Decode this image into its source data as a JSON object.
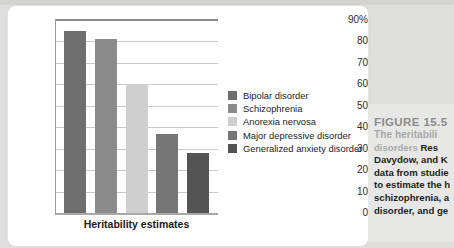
{
  "chart_data": {
    "type": "bar",
    "title": "",
    "xlabel": "Heritability estimates",
    "ylabel": "",
    "categories": [
      "Bipolar disorder",
      "Schizophrenia",
      "Anorexia nervosa",
      "Major depressive disorder",
      "Generalized anxiety disorder"
    ],
    "values": [
      85,
      81,
      60,
      37,
      28
    ],
    "colors": [
      "#6e6e6e",
      "#8a8a8a",
      "#cfcfcf",
      "#767676",
      "#545454"
    ],
    "ylim": [
      0,
      90
    ],
    "yticks": [
      "90%",
      "80",
      "70",
      "60",
      "50",
      "40",
      "30",
      "20",
      "10",
      "0"
    ],
    "ytick_values": [
      90,
      80,
      70,
      60,
      50,
      40,
      30,
      20,
      10,
      0
    ],
    "grid": true,
    "legend_position": "right"
  },
  "legend": {
    "items": [
      {
        "label": "Bipolar disorder",
        "color": "#6e6e6e"
      },
      {
        "label": "Schizophrenia",
        "color": "#8a8a8a"
      },
      {
        "label": "Anorexia nervosa",
        "color": "#cfcfcf"
      },
      {
        "label": "Major depressive disorder",
        "color": "#767676"
      },
      {
        "label": "Generalized anxiety disorder",
        "color": "#545454"
      }
    ]
  },
  "caption": {
    "figure_number": "FIGURE 15.5",
    "title_line1": "The heritabili",
    "title_line2": "disorders ",
    "body_line2_tail": "Res",
    "body_line3": "Davydow, and K",
    "body_line4": "data from studie",
    "body_line5": "to estimate the h",
    "body_line6": "schizophrenia, a",
    "body_line7": "disorder, and ge"
  }
}
